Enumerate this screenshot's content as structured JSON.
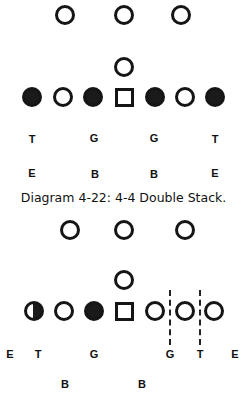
{
  "diagrams": [
    {
      "id": "top",
      "players": [
        {
          "type": "circle",
          "x": 65,
          "y": 15
        },
        {
          "type": "circle",
          "x": 124,
          "y": 15
        },
        {
          "type": "circle",
          "x": 181,
          "y": 15
        },
        {
          "type": "circle",
          "x": 124,
          "y": 67
        },
        {
          "type": "filled",
          "x": 32,
          "y": 97
        },
        {
          "type": "circle",
          "x": 63,
          "y": 97
        },
        {
          "type": "filled",
          "x": 93,
          "y": 97
        },
        {
          "type": "square",
          "x": 124,
          "y": 97
        },
        {
          "type": "filled",
          "x": 155,
          "y": 97
        },
        {
          "type": "circle",
          "x": 185,
          "y": 97
        },
        {
          "type": "filled",
          "x": 215,
          "y": 97
        }
      ],
      "labels": [
        {
          "text": "T",
          "x": 32,
          "y": 139
        },
        {
          "text": "G",
          "x": 94,
          "y": 138
        },
        {
          "text": "G",
          "x": 154,
          "y": 138
        },
        {
          "text": "T",
          "x": 215,
          "y": 139
        },
        {
          "text": "E",
          "x": 32,
          "y": 173
        },
        {
          "text": "B",
          "x": 95,
          "y": 174
        },
        {
          "text": "B",
          "x": 154,
          "y": 174
        },
        {
          "text": "E",
          "x": 215,
          "y": 173
        }
      ],
      "dashed_lines": []
    },
    {
      "id": "bottom",
      "players": [
        {
          "type": "circle",
          "x": 70,
          "y": 230
        },
        {
          "type": "circle",
          "x": 124,
          "y": 230
        },
        {
          "type": "circle",
          "x": 185,
          "y": 230
        },
        {
          "type": "circle",
          "x": 124,
          "y": 280
        },
        {
          "type": "half",
          "x": 34,
          "y": 311
        },
        {
          "type": "circle",
          "x": 64,
          "y": 311
        },
        {
          "type": "filled",
          "x": 94,
          "y": 311
        },
        {
          "type": "square",
          "x": 124,
          "y": 311
        },
        {
          "type": "circle",
          "x": 155,
          "y": 311
        },
        {
          "type": "circle",
          "x": 185,
          "y": 311
        },
        {
          "type": "circle",
          "x": 214,
          "y": 311
        }
      ],
      "labels": [
        {
          "text": "E",
          "x": 10,
          "y": 354
        },
        {
          "text": "T",
          "x": 38,
          "y": 354
        },
        {
          "text": "G",
          "x": 94,
          "y": 354
        },
        {
          "text": "G",
          "x": 170,
          "y": 354
        },
        {
          "text": "T",
          "x": 200,
          "y": 354
        },
        {
          "text": "E",
          "x": 235,
          "y": 354
        },
        {
          "text": "B",
          "x": 65,
          "y": 384
        },
        {
          "text": "B",
          "x": 142,
          "y": 384
        }
      ],
      "dashed_lines": [
        {
          "x": 170,
          "y1": 290,
          "y2": 345
        },
        {
          "x": 200,
          "y1": 290,
          "y2": 345
        }
      ]
    }
  ],
  "caption": {
    "text": "Diagram 4-22: 4-4 Double Stack.",
    "y": 190
  },
  "player_size": 20
}
